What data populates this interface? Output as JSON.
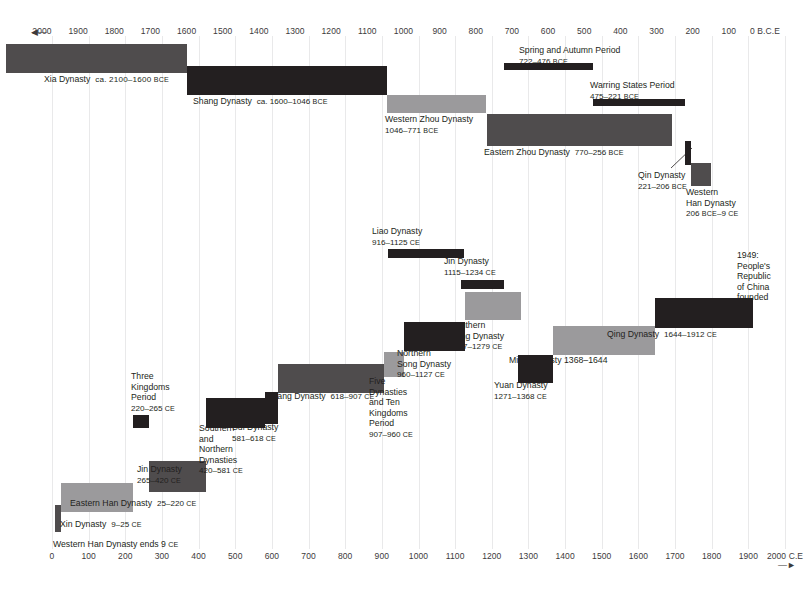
{
  "chart_data": {
    "type": "bar",
    "orientation": "horizontal-timeline",
    "grid": true,
    "legend_position": "none",
    "top_axis": {
      "label": "0 B.C.E",
      "direction_marker": "◄—",
      "ticks": [
        "2000",
        "1900",
        "1800",
        "1700",
        "1600",
        "1500",
        "1400",
        "1300",
        "1200",
        "1100",
        "1000",
        "900",
        "800",
        "700",
        "600",
        "500",
        "400",
        "300",
        "200",
        "100",
        "0"
      ],
      "unit": "BCE",
      "range": [
        -2000,
        0
      ]
    },
    "bottom_axis": {
      "label": "2000 C.E",
      "direction_marker": "—►",
      "ticks": [
        "0",
        "100",
        "200",
        "300",
        "400",
        "500",
        "600",
        "700",
        "800",
        "900",
        "1000",
        "1100",
        "1200",
        "1300",
        "1400",
        "1500",
        "1600",
        "1700",
        "1800",
        "1900",
        "2000"
      ],
      "unit": "CE",
      "range": [
        0,
        2000
      ]
    },
    "colors": {
      "dark": "#231f20",
      "mid": "#4f4c4d",
      "light": "#9b9a9c",
      "grid": "#e9e9ea",
      "text": "#231f20"
    },
    "bars": [
      {
        "name": "Xia Dynasty",
        "label": "Xia Dynasty",
        "dates": "ca. 2100–1600",
        "era": "BCE",
        "start": -2100,
        "end": -1600,
        "color": "mid"
      },
      {
        "name": "Shang Dynasty",
        "label": "Shang Dynasty",
        "dates": "ca. 1600–1046",
        "era": "BCE",
        "start": -1600,
        "end": -1046,
        "color": "dark"
      },
      {
        "name": "Western Zhou Dynasty",
        "label": "Western Zhou Dynasty",
        "dates": "1046–771",
        "era": "BCE",
        "start": -1046,
        "end": -771,
        "color": "light"
      },
      {
        "name": "Eastern Zhou Dynasty",
        "label": "Eastern Zhou Dynasty",
        "dates": "770–256",
        "era": "BCE",
        "start": -770,
        "end": -256,
        "color": "mid"
      },
      {
        "name": "Spring and Autumn Period",
        "label": "Spring and Autumn Period",
        "dates": "722–476",
        "era": "BCE",
        "start": -722,
        "end": -476,
        "color": "dark"
      },
      {
        "name": "Warring States Period",
        "label": "Warring States Period",
        "dates": "475–221",
        "era": "BCE",
        "start": -475,
        "end": -221,
        "color": "dark"
      },
      {
        "name": "Qin Dynasty",
        "label": "Qin Dynasty",
        "dates": "221–206",
        "era": "BCE",
        "start": -221,
        "end": -206,
        "color": "dark"
      },
      {
        "name": "Western Han Dynasty",
        "label": "Western Han Dynasty",
        "dates": "206 BCE–9 CE",
        "era": "",
        "start": -206,
        "end": 9,
        "color": "mid"
      },
      {
        "name": "Xin Dynasty",
        "label": "Xin Dynasty",
        "dates": "9–25",
        "era": "CE",
        "start": 9,
        "end": 25,
        "color": "mid"
      },
      {
        "name": "Eastern Han Dynasty",
        "label": "Eastern Han Dynasty",
        "dates": "25–220",
        "era": "CE",
        "start": 25,
        "end": 220,
        "color": "light"
      },
      {
        "name": "Three Kingdoms Period",
        "label": "Three Kingdoms Period",
        "dates": "220–265",
        "era": "CE",
        "start": 220,
        "end": 265,
        "color": "dark"
      },
      {
        "name": "Jin Dynasty (265-420)",
        "label": "Jin Dynasty",
        "dates": "265–420",
        "era": "CE",
        "start": 265,
        "end": 420,
        "color": "mid"
      },
      {
        "name": "Southern and Northern Dynasties",
        "label": "Southern and Northern Dynasties",
        "dates": "420–581",
        "era": "CE",
        "start": 420,
        "end": 581,
        "color": "dark"
      },
      {
        "name": "Sui Dynasty",
        "label": "Sui Dynasty",
        "dates": "581–618",
        "era": "CE",
        "start": 581,
        "end": 618,
        "color": "dark"
      },
      {
        "name": "Tang Dynasty",
        "label": "Tang Dynasty",
        "dates": "618–907",
        "era": "CE",
        "start": 618,
        "end": 907,
        "color": "mid"
      },
      {
        "name": "Five Dynasties and Ten Kingdoms Period",
        "label": "Five Dynasties and Ten Kingdoms Period",
        "dates": "907–960",
        "era": "CE",
        "start": 907,
        "end": 960,
        "color": "light"
      },
      {
        "name": "Liao Dynasty",
        "label": "Liao Dynasty",
        "dates": "916–1125",
        "era": "CE",
        "start": 916,
        "end": 1125,
        "color": "dark"
      },
      {
        "name": "Northern Song Dynasty",
        "label": "Northern Song Dynasty",
        "dates": "960–1127",
        "era": "CE",
        "start": 960,
        "end": 1127,
        "color": "dark"
      },
      {
        "name": "Jin Dynasty (1115-1234)",
        "label": "Jin Dynasty",
        "dates": "1115–1234",
        "era": "CE",
        "start": 1115,
        "end": 1234,
        "color": "dark"
      },
      {
        "name": "Southern Song Dynasty",
        "label": "Southern Song Dynasty",
        "dates": "1127–1279",
        "era": "CE",
        "start": 1127,
        "end": 1279,
        "color": "light"
      },
      {
        "name": "Yuan Dynasty",
        "label": "Yuan Dynasty",
        "dates": "1271–1368",
        "era": "CE",
        "start": 1271,
        "end": 1368,
        "color": "dark"
      },
      {
        "name": "Ming Dynasty",
        "label": "Ming Dynasty",
        "dates": "1368–1644",
        "era": "",
        "start": 1368,
        "end": 1644,
        "color": "light"
      },
      {
        "name": "Qing Dynasty",
        "label": "Qing Dynasty",
        "dates": "1644–1912",
        "era": "CE",
        "start": 1644,
        "end": 1912,
        "color": "dark"
      }
    ],
    "annotations": [
      {
        "name": "prc-founded",
        "lines": [
          "1949:",
          "People's",
          "Republic",
          "of China",
          "founded"
        ]
      },
      {
        "name": "western-han-ends",
        "text": "Western Han Dynasty ends 9",
        "era": "CE"
      }
    ]
  },
  "labels": {
    "xia": "Xia Dynasty",
    "xia_dates": "ca. 2100–1600",
    "shang": "Shang Dynasty",
    "shang_dates": "ca. 1600–1046",
    "wzhou_l1": "Western Zhou Dynasty",
    "wzhou_l2": "1046–771",
    "ezhou": "Eastern Zhou Dynasty",
    "ezhou_dates": "770–256",
    "spring_l1": "Spring and Autumn Period",
    "spring_l2": "722–476",
    "warring_l1": "Warring States Period",
    "warring_l2": "475–221",
    "qin_l1": "Qin Dynasty",
    "qin_l2": "221–206",
    "whan_l1": "Western",
    "whan_l2": "Han Dynasty",
    "whan_l3a": "206 ",
    "whan_l3b": "BCE",
    "whan_l3c": "–9 ",
    "whan_l3d": "CE",
    "liao_l1": "Liao Dynasty",
    "liao_l2": "916–1125",
    "jin2_l1": "Jin Dynasty",
    "jin2_l2": "1115–1234",
    "ssong_l1": "Southern",
    "ssong_l2": "Song Dynasty",
    "ssong_l3": "1127–1279",
    "nsong_l1": "Northern",
    "nsong_l2": "Song Dynasty",
    "nsong_l3": "960–1127",
    "five_l1": "Five",
    "five_l2": "Dynasties",
    "five_l3": "and Ten",
    "five_l4": "Kingdoms",
    "five_l5": "Period",
    "five_l6": "907–960",
    "qing": "Qing Dynasty",
    "qing_dates": "1644–1912",
    "ming": "Ming Dynasty 1368–1644",
    "yuan_l1": "Yuan Dynasty",
    "yuan_l2": "1271–1368",
    "tang": "Tang Dynasty",
    "tang_dates": "618–907",
    "three_l1": "Three",
    "three_l2": "Kingdoms",
    "three_l3": "Period",
    "three_l4": "220–265",
    "sui_l1": "Sui Dynasty",
    "sui_l2": "581–618",
    "snd_l1": "Southern",
    "snd_l2": "and",
    "snd_l3": "Northern",
    "snd_l4": "Dynasties",
    "snd_l5": "420–581",
    "jin1_l1": "Jin Dynasty",
    "jin1_l2": "265–420",
    "ehan": "Eastern Han Dynasty",
    "ehan_dates": "25–220",
    "xin": "Xin Dynasty",
    "xin_dates": "9–25",
    "whan_ends": "Western Han Dynasty ends 9",
    "prc_1": "1949:",
    "prc_2": "People's",
    "prc_3": "Republic",
    "prc_4": "of China",
    "prc_5": "founded",
    "ce": "CE",
    "bce": "BCE"
  }
}
